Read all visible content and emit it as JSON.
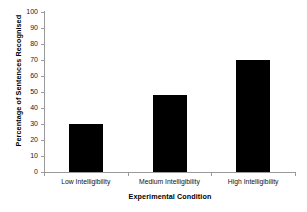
{
  "chart_data": {
    "type": "bar",
    "title": "",
    "categories": [
      "Low Intelligibility",
      "Medium Intelligibility",
      "High Intelligibility"
    ],
    "values": [
      30,
      48,
      70
    ],
    "xlabel": "Experimental Condition",
    "ylabel": "Percentage of Sentences Recognised",
    "ylim": [
      0,
      100
    ],
    "ytick_labels": [
      "0",
      "10",
      "20",
      "30",
      "40",
      "50",
      "60",
      "70",
      "80",
      "90",
      "100"
    ],
    "ytick_values": [
      0,
      10,
      20,
      30,
      40,
      50,
      60,
      70,
      80,
      90,
      100
    ],
    "grid": false,
    "legend": false,
    "bar_color": "#000000",
    "axis_color": "#9a9a9a",
    "background_color": "#ffffff"
  }
}
